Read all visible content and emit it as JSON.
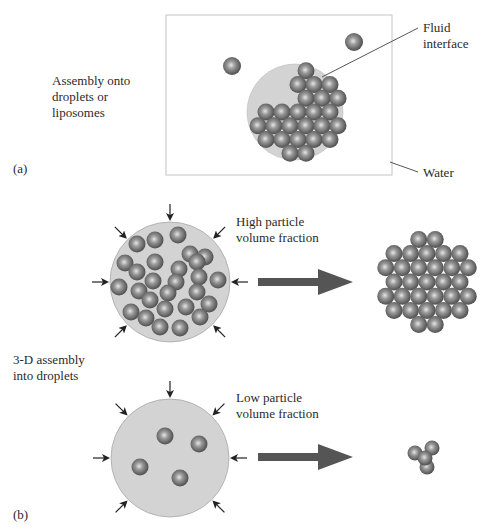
{
  "panel_a": {
    "tag": "(a)",
    "description": "Assembly onto\ndroplets or\nliposomes",
    "callouts": {
      "fluid_interface": "Fluid\ninterface",
      "water": "Water"
    }
  },
  "panel_b": {
    "tag": "(b)",
    "description": "3-D assembly\ninto droplets",
    "high": {
      "label": "High particle\nvolume fraction"
    },
    "low": {
      "label": "Low particle\nvolume fraction"
    }
  },
  "colors": {
    "droplet_fill": "#d3d3d3",
    "droplet_stroke": "#a8a8a8",
    "particle_light": "#d8d8d8",
    "particle_mid": "#8a8a8a",
    "particle_dark": "#4a4a4a",
    "big_arrow": "#555555",
    "small_arrow": "#222222",
    "frame": "#bdbdbd"
  }
}
